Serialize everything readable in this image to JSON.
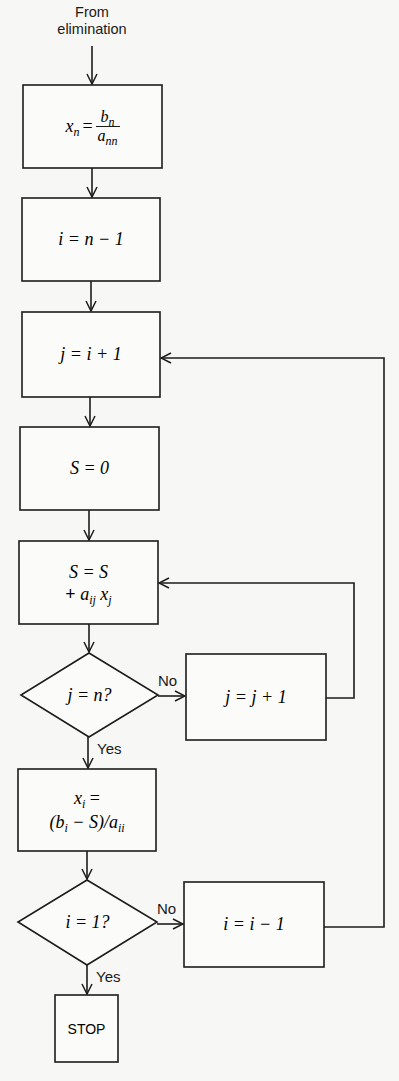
{
  "diagram": {
    "type": "flowchart",
    "start_label_line1": "From",
    "start_label_line2": "elimination",
    "nodes": [
      {
        "id": "xn",
        "kind": "process",
        "text": "x_n = b_n / a_nn",
        "parts": {
          "lhs": "x",
          "lhs_sub": "n",
          "eq": "=",
          "num": "b",
          "num_sub": "n",
          "den": "a",
          "den_sub": "nn"
        }
      },
      {
        "id": "i_init",
        "kind": "process",
        "text": "i = n − 1"
      },
      {
        "id": "j_init",
        "kind": "process",
        "text": "j = i + 1"
      },
      {
        "id": "s_init",
        "kind": "process",
        "text": "S = 0"
      },
      {
        "id": "s_acc",
        "kind": "process",
        "line1": "S = S",
        "line2_plus": "+",
        "line2_a": "a",
        "line2_a_sub": "ij",
        "line2_x": "x",
        "line2_x_sub": "j"
      },
      {
        "id": "j_check",
        "kind": "decision",
        "text": "j = n?"
      },
      {
        "id": "j_inc",
        "kind": "process",
        "text": "j = j + 1"
      },
      {
        "id": "xi",
        "kind": "process",
        "line1_x": "x",
        "line1_sub": "i",
        "line1_eq": " =",
        "line2_open": "(b",
        "line2_b_sub": "i",
        "line2_mid": " − S)/a",
        "line2_a_sub": "ii"
      },
      {
        "id": "i_check",
        "kind": "decision",
        "text": "i = 1?"
      },
      {
        "id": "i_dec",
        "kind": "process",
        "text": "i = i − 1"
      },
      {
        "id": "stop",
        "kind": "terminal",
        "text": "STOP"
      }
    ],
    "edge_labels": {
      "j_check_no": "No",
      "j_check_yes": "Yes",
      "i_check_no": "No",
      "i_check_yes": "Yes"
    },
    "edges": [
      {
        "from": "start",
        "to": "xn"
      },
      {
        "from": "xn",
        "to": "i_init"
      },
      {
        "from": "i_init",
        "to": "j_init"
      },
      {
        "from": "j_init",
        "to": "s_init"
      },
      {
        "from": "s_init",
        "to": "s_acc"
      },
      {
        "from": "s_acc",
        "to": "j_check"
      },
      {
        "from": "j_check",
        "to": "j_inc",
        "label": "No"
      },
      {
        "from": "j_inc",
        "to": "s_acc"
      },
      {
        "from": "j_check",
        "to": "xi",
        "label": "Yes"
      },
      {
        "from": "xi",
        "to": "i_check"
      },
      {
        "from": "i_check",
        "to": "i_dec",
        "label": "No"
      },
      {
        "from": "i_dec",
        "to": "j_init"
      },
      {
        "from": "i_check",
        "to": "stop",
        "label": "Yes"
      }
    ]
  }
}
